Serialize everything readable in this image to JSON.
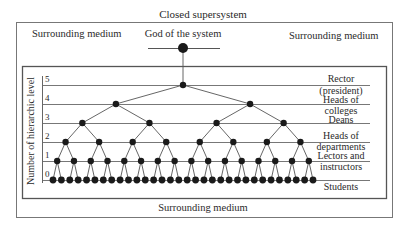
{
  "title": "Closed supersystem",
  "surrounding_left": "Surrounding medium",
  "surrounding_right": "Surrounding medium",
  "surrounding_bottom": "Surrounding medium",
  "god_label": "God of the system",
  "axis_title": "Number of hierarchic level",
  "levels": [
    {
      "number": "5",
      "y": 85
    },
    {
      "number": "4",
      "y": 104
    },
    {
      "number": "3",
      "y": 123
    },
    {
      "number": "2",
      "y": 142
    },
    {
      "number": "1",
      "y": 161
    },
    {
      "number": "0",
      "y": 180
    }
  ],
  "role_labels": [
    {
      "text": "Rector",
      "y": 74
    },
    {
      "text": "(president)",
      "y": 86
    },
    {
      "text": "Heads of",
      "y": 95
    },
    {
      "text": "colleges",
      "y": 106
    },
    {
      "text": "Deans",
      "y": 115
    },
    {
      "text": "Heads of",
      "y": 131
    },
    {
      "text": "departments",
      "y": 142
    },
    {
      "text": "Lectors and",
      "y": 151
    },
    {
      "text": "instructors",
      "y": 162
    },
    {
      "text": "Students",
      "y": 182
    }
  ],
  "tree": {
    "branching": 2,
    "depth": 5,
    "x_min": 53,
    "x_max": 313,
    "root_x": 183,
    "god_y": 48,
    "node_color": "#1a1a1a",
    "line_color": "#555555"
  }
}
